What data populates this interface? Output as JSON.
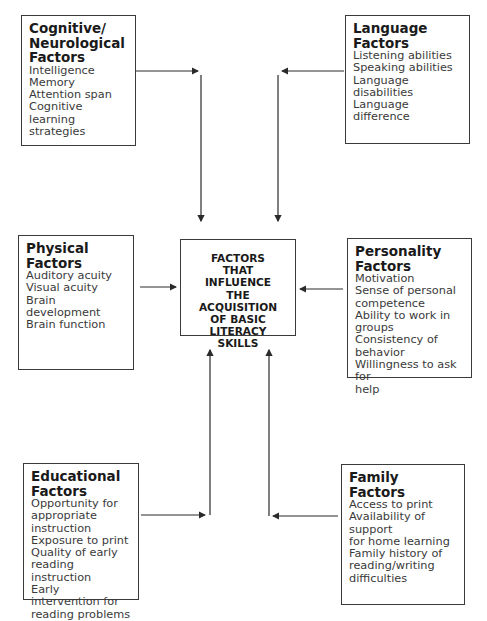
{
  "center": {
    "text": "FACTORS\nTHAT\nINFLUENCE\nTHE ACQUISITION\nOF BASIC LITERACY\nSKILLS"
  },
  "boxes": {
    "cognitive": {
      "title": "Cognitive/\nNeurological\nFactors",
      "items": [
        "Intelligence",
        "Memory",
        "Attention span",
        "Cognitive learning\nstrategies"
      ]
    },
    "language": {
      "title": "Language Factors",
      "items": [
        "Listening abilities",
        "Speaking abilities",
        "Language disabilities",
        "Language difference"
      ]
    },
    "physical": {
      "title": "Physical Factors",
      "items": [
        "Auditory acuity",
        "Visual acuity",
        "Brain development",
        "Brain function"
      ]
    },
    "personality": {
      "title": "Personality Factors",
      "items": [
        "Motivation",
        "Sense of personal\ncompetence",
        "Ability to work in groups",
        "Consistency of behavior",
        "Willingness to ask for\nhelp"
      ]
    },
    "educational": {
      "title": "Educational\nFactors",
      "items": [
        "Opportunity for\nappropriate\ninstruction",
        "Exposure to print",
        "Quality of early\nreading instruction",
        "Early intervention for\nreading problems"
      ]
    },
    "family": {
      "title": "Family Factors",
      "items": [
        "Access to print",
        "Availability of support\nfor home learning",
        "Family history of\nreading/writing\ndifficulties"
      ]
    }
  },
  "colors": {
    "line": "#2a2a2a",
    "border": "#3a3a3a",
    "background": "#ffffff"
  }
}
